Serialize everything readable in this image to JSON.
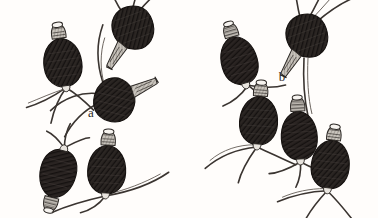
{
  "figure": {
    "background_color": "#fffdfb",
    "ink_color": "#2b2724",
    "body_fill": "#262220",
    "collar_fill": "#8d8882",
    "panels": [
      {
        "label": "a",
        "label_x": 91,
        "label_y": 117,
        "organism_count": 5,
        "organisms": [
          {
            "id": "a1",
            "cx": 62,
            "cy": 58,
            "rx": 19,
            "ry": 26,
            "rotate": -8,
            "collar": "top",
            "spines": 3,
            "spine_side": "bottom-left"
          },
          {
            "id": "a2",
            "cx": 130,
            "cy": 31,
            "rx": 22,
            "ry": 17,
            "rotate": -22,
            "collar": "left",
            "spines": 3,
            "spine_side": "right"
          },
          {
            "id": "a3",
            "cx": 120,
            "cy": 96,
            "rx": 20,
            "ry": 16,
            "rotate": 12,
            "collar": "right",
            "spines": 3,
            "spine_side": "left"
          },
          {
            "id": "a4",
            "cx": 57,
            "cy": 177,
            "rx": 17,
            "ry": 24,
            "rotate": 14,
            "collar": "bottom",
            "spines": 3,
            "spine_side": "top"
          },
          {
            "id": "a5",
            "cx": 107,
            "cy": 165,
            "rx": 18,
            "ry": 25,
            "rotate": 3,
            "collar": "top",
            "spines": 3,
            "spine_side": "bottom"
          }
        ]
      },
      {
        "label": "b",
        "label_x": 282,
        "label_y": 81,
        "organism_count": 6,
        "organisms": [
          {
            "id": "b1",
            "cx": 240,
            "cy": 57,
            "rx": 19,
            "ry": 27,
            "rotate": -14,
            "collar": "top",
            "spines": 3,
            "spine_side": "bottom-right"
          },
          {
            "id": "b2",
            "cx": 303,
            "cy": 38,
            "rx": 24,
            "ry": 19,
            "rotate": -24,
            "collar": "left",
            "spines": 4,
            "spine_side": "right"
          },
          {
            "id": "b3",
            "cx": 259,
            "cy": 115,
            "rx": 19,
            "ry": 26,
            "rotate": 4,
            "collar": "top",
            "spines": 3,
            "spine_side": "bottom"
          },
          {
            "id": "b4",
            "cx": 299,
            "cy": 131,
            "rx": 18,
            "ry": 26,
            "rotate": -3,
            "collar": "top",
            "spines": 3,
            "spine_side": "bottom"
          },
          {
            "id": "b5",
            "cx": 331,
            "cy": 160,
            "rx": 19,
            "ry": 26,
            "rotate": 7,
            "collar": "top",
            "spines": 3,
            "spine_side": "bottom"
          },
          {
            "id": "b6",
            "cx": 304,
            "cy": 70,
            "rx": 0,
            "ry": 0,
            "rotate": 0,
            "collar": "none",
            "spines": 1,
            "spine_side": "vertical"
          }
        ]
      }
    ]
  },
  "caption": {
    "label_a": "a",
    "label_b": "b"
  }
}
